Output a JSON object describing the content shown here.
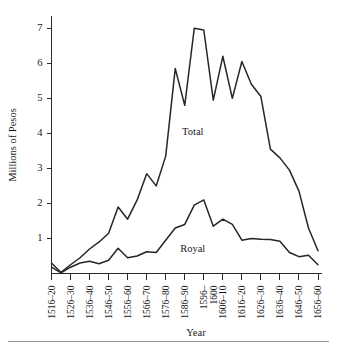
{
  "chart_data": {
    "type": "line",
    "title": "",
    "xlabel": "Year",
    "ylabel": "Millions of Pesos",
    "ylim": [
      0,
      7.35
    ],
    "yticks": [
      1,
      2,
      3,
      4,
      5,
      6,
      7
    ],
    "ytick_labels": [
      "1",
      "2",
      "3",
      "4",
      "5",
      "6",
      "7"
    ],
    "grid": false,
    "legend_position": "inline-annotation",
    "categories": [
      "1516-20",
      "1521-25",
      "1526-30",
      "1531-35",
      "1536-40",
      "1541-45",
      "1546-50",
      "1551-55",
      "1556-60",
      "1561-65",
      "1566-70",
      "1571-75",
      "1576-80",
      "1581-85",
      "1586-90",
      "1591-95",
      "1596-1600",
      "1601-05",
      "1606-10",
      "1611-15",
      "1616-20",
      "1621-25",
      "1626-30",
      "1631-35",
      "1636-40",
      "1641-45",
      "1646-50",
      "1651-55",
      "1656-60"
    ],
    "xtick_labels": [
      "1516–20",
      "1526–30",
      "1536–40",
      "1546–50",
      "1556–60",
      "1566–70",
      "1576–80",
      "1586–90",
      "1596–1600",
      "1606–10",
      "1616–20",
      "1626–30",
      "1636–40",
      "1646–50",
      "1656–60"
    ],
    "xtick_label_lines": [
      [
        "1516–20"
      ],
      [
        "1526–30"
      ],
      [
        "1536–40"
      ],
      [
        "1546–50"
      ],
      [
        "1556–60"
      ],
      [
        "1566–70"
      ],
      [
        "1576–80"
      ],
      [
        "1586–90"
      ],
      [
        "1596–",
        "1600"
      ],
      [
        "1606–10"
      ],
      [
        "1616–20"
      ],
      [
        "1626–30"
      ],
      [
        "1636–40"
      ],
      [
        "1646–50"
      ],
      [
        "1656–60"
      ]
    ],
    "xtick_category_index": [
      0,
      2,
      4,
      6,
      8,
      10,
      12,
      14,
      16,
      18,
      20,
      22,
      24,
      26,
      28
    ],
    "series": [
      {
        "name": "Total",
        "label": "Total",
        "color": "#262626",
        "label_at_category": "1586-90",
        "values": [
          0.3,
          0.03,
          0.25,
          0.45,
          0.7,
          0.9,
          1.15,
          1.9,
          1.55,
          2.1,
          2.85,
          2.5,
          3.35,
          5.85,
          4.8,
          7.0,
          6.95,
          4.95,
          6.2,
          5.0,
          6.05,
          5.4,
          5.05,
          3.55,
          3.3,
          2.95,
          2.35,
          1.3,
          0.65
        ]
      },
      {
        "name": "Royal",
        "label": "Royal",
        "color": "#262626",
        "label_at_category": "1586-90",
        "values": [
          0.18,
          0.02,
          0.18,
          0.3,
          0.35,
          0.28,
          0.38,
          0.72,
          0.45,
          0.5,
          0.62,
          0.6,
          0.95,
          1.3,
          1.4,
          1.95,
          2.1,
          1.35,
          1.55,
          1.4,
          0.95,
          1.0,
          0.98,
          0.97,
          0.92,
          0.6,
          0.48,
          0.52,
          0.25
        ]
      }
    ]
  },
  "figure": {
    "caption_rule": true
  }
}
